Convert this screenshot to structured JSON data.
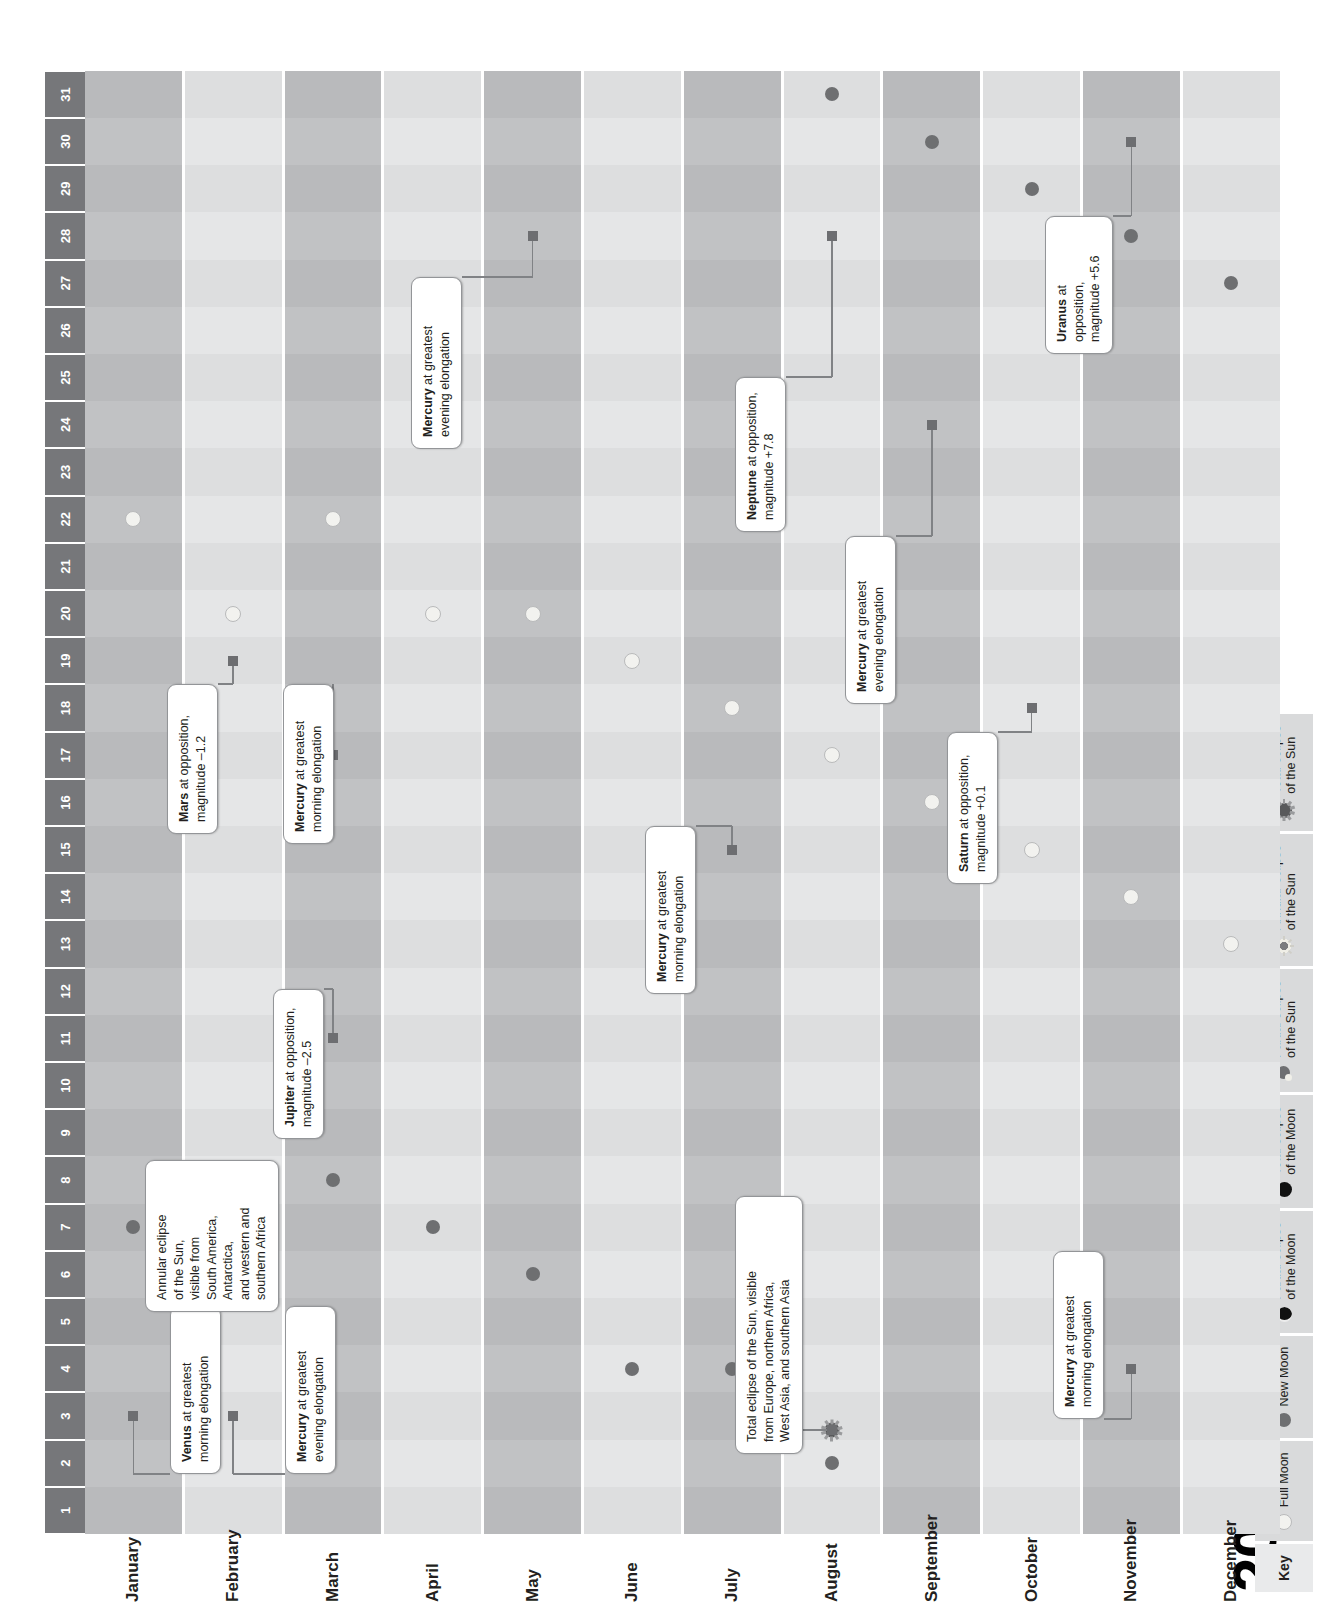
{
  "title": "2027",
  "key": {
    "label": "Key",
    "items": [
      {
        "icon": "full-moon-icon",
        "glyph": "g-full",
        "label": "Full Moon",
        "bold": ""
      },
      {
        "icon": "new-moon-icon",
        "glyph": "g-new",
        "label": "New Moon",
        "bold": ""
      },
      {
        "icon": "partial-lunar-eclipse-icon",
        "glyph": "g-plunar",
        "label": "Partial eclipse\nof the Moon",
        "bold": ""
      },
      {
        "icon": "total-lunar-eclipse-icon",
        "glyph": "g-tlunar",
        "label": "Total eclipse\nof the Moon",
        "bold": ""
      },
      {
        "icon": "partial-solar-eclipse-icon",
        "glyph": "g-psolar",
        "label": "Partial eclipse\nof the Sun",
        "bold": ""
      },
      {
        "icon": "annular-solar-eclipse-icon",
        "glyph": "g-asolar",
        "label": "Annular eclipse\nof the Sun",
        "bold": ""
      },
      {
        "icon": "total-solar-eclipse-icon",
        "glyph": "g-tsolar",
        "label": "Total eclipse\nof the Sun",
        "bold": ""
      }
    ]
  },
  "chart_data": {
    "type": "table",
    "title": "2027",
    "xlabel": "Day of month",
    "ylabel": "Month",
    "days": [
      1,
      2,
      3,
      4,
      5,
      6,
      7,
      8,
      9,
      10,
      11,
      12,
      13,
      14,
      15,
      16,
      17,
      18,
      19,
      20,
      21,
      22,
      23,
      24,
      25,
      26,
      27,
      28,
      29,
      30,
      31
    ],
    "months": [
      "January",
      "February",
      "March",
      "April",
      "May",
      "June",
      "July",
      "August",
      "September",
      "October",
      "November",
      "December"
    ],
    "events": [
      {
        "month": "January",
        "day": 7,
        "type": "new-moon"
      },
      {
        "month": "January",
        "day": 22,
        "type": "full-moon"
      },
      {
        "month": "February",
        "day": 6,
        "type": "new-moon"
      },
      {
        "month": "February",
        "day": 6.7,
        "type": "annular-solar-eclipse"
      },
      {
        "month": "February",
        "day": 20,
        "type": "full-moon"
      },
      {
        "month": "March",
        "day": 8,
        "type": "new-moon"
      },
      {
        "month": "March",
        "day": 22,
        "type": "full-moon"
      },
      {
        "month": "April",
        "day": 7,
        "type": "new-moon"
      },
      {
        "month": "April",
        "day": 20,
        "type": "full-moon"
      },
      {
        "month": "May",
        "day": 6,
        "type": "new-moon"
      },
      {
        "month": "May",
        "day": 20,
        "type": "full-moon"
      },
      {
        "month": "June",
        "day": 4,
        "type": "new-moon"
      },
      {
        "month": "June",
        "day": 19,
        "type": "full-moon"
      },
      {
        "month": "July",
        "day": 4,
        "type": "new-moon"
      },
      {
        "month": "July",
        "day": 18,
        "type": "full-moon"
      },
      {
        "month": "August",
        "day": 2,
        "type": "new-moon"
      },
      {
        "month": "August",
        "day": 2.7,
        "type": "total-solar-eclipse"
      },
      {
        "month": "August",
        "day": 17,
        "type": "full-moon"
      },
      {
        "month": "August",
        "day": 31,
        "type": "new-moon"
      },
      {
        "month": "September",
        "day": 16,
        "type": "full-moon"
      },
      {
        "month": "September",
        "day": 30,
        "type": "new-moon"
      },
      {
        "month": "October",
        "day": 15,
        "type": "full-moon"
      },
      {
        "month": "October",
        "day": 29,
        "type": "new-moon"
      },
      {
        "month": "November",
        "day": 14,
        "type": "full-moon"
      },
      {
        "month": "November",
        "day": 28,
        "type": "new-moon"
      },
      {
        "month": "December",
        "day": 13,
        "type": "full-moon"
      },
      {
        "month": "December",
        "day": 27,
        "type": "new-moon"
      }
    ],
    "annotations": [
      {
        "id": "venus-jan",
        "month": "January",
        "day": 3,
        "bold": "Venus",
        "rest": " at greatest\nmorning elongation"
      },
      {
        "id": "mercury-feb",
        "month": "February",
        "day": 3,
        "bold": "Mercury",
        "rest": " at greatest\nevening elongation"
      },
      {
        "id": "annular-eclipse-feb",
        "month": "February",
        "day": 6.7,
        "bold": "",
        "rest": "Annular eclipse\nof the Sun,\nvisible from\nSouth America,\nAntarctica,\nand western and\nsouthern Africa"
      },
      {
        "id": "jupiter-mar",
        "month": "March",
        "day": 11,
        "bold": "Jupiter",
        "rest": " at opposition,\nmagnitude –2.5"
      },
      {
        "id": "mars-feb",
        "month": "February",
        "day": 19,
        "bold": "Mars",
        "rest": " at opposition,\nmagnitude –1.2"
      },
      {
        "id": "mercury-mar",
        "month": "March",
        "day": 17,
        "bold": "Mercury",
        "rest": " at greatest\nmorning elongation"
      },
      {
        "id": "mercury-may",
        "month": "May",
        "day": 28,
        "bold": "Mercury",
        "rest": " at greatest\nevening elongation"
      },
      {
        "id": "mercury-jul",
        "month": "July",
        "day": 15,
        "bold": "Mercury",
        "rest": " at greatest\nmorning elongation"
      },
      {
        "id": "total-eclipse-aug",
        "month": "August",
        "day": 2.7,
        "bold": "",
        "rest": "Total eclipse of the Sun, visible\nfrom Europe, northern Africa,\nWest Asia, and southern Asia"
      },
      {
        "id": "neptune-aug",
        "month": "August",
        "day": 28,
        "bold": "Neptune",
        "rest": " at opposition,\nmagnitude +7.8"
      },
      {
        "id": "mercury-sep",
        "month": "September",
        "day": 24,
        "bold": "Mercury",
        "rest": " at greatest\nevening elongation"
      },
      {
        "id": "saturn-oct",
        "month": "October",
        "day": 18,
        "bold": "Saturn",
        "rest": " at opposition,\nmagnitude +0.1"
      },
      {
        "id": "mercury-nov",
        "month": "November",
        "day": 4,
        "bold": "Mercury",
        "rest": " at greatest\nmorning elongation"
      },
      {
        "id": "uranus-nov",
        "month": "November",
        "day": 30,
        "bold": "Uranus",
        "rest": " at opposition,\nmagnitude +5.6"
      }
    ]
  },
  "colors": {
    "header": "#76777a",
    "row_dark": "#b9babc",
    "row_light": "#dddedf",
    "callout_border": "#939598",
    "leader": "#6d6e71"
  }
}
